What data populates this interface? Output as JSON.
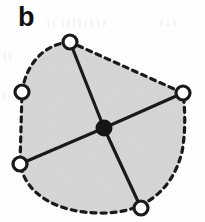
{
  "figure": {
    "panel_label": "b",
    "caption_text": "",
    "type": "node-link-diagram"
  },
  "style": {
    "background_color": "#fefefe",
    "region_fill_color": "#d6d6d6",
    "region_stroke_color": "#1a1a1a",
    "region_stroke_width": 3.2,
    "region_dash_pattern": "5 5",
    "spoke_color": "#1a1a1a",
    "spoke_width": 3.2,
    "node_fill_color": "#ffffff",
    "node_stroke_color": "#1a1a1a",
    "node_stroke_width": 3.2,
    "node_radius": 7,
    "hub_fill_color": "#151515",
    "hub_radius": 8.5,
    "label_color": "#111111"
  },
  "graph": {
    "hub": {
      "id": "hub",
      "name": "central-hub",
      "x": 104,
      "y": 128,
      "filled": true
    },
    "nodes": [
      {
        "id": "n1",
        "name": "node-top",
        "x": 70,
        "y": 42,
        "filled": false
      },
      {
        "id": "n2",
        "name": "node-upper-left",
        "x": 22,
        "y": 92,
        "filled": false
      },
      {
        "id": "n3",
        "name": "node-right",
        "x": 183,
        "y": 93,
        "filled": false
      },
      {
        "id": "n4",
        "name": "node-lower-left",
        "x": 20,
        "y": 164,
        "filled": false
      },
      {
        "id": "n5",
        "name": "node-bottom",
        "x": 141,
        "y": 208,
        "filled": false
      }
    ],
    "edges": [
      {
        "id": "e1",
        "name": "spoke-hub-to-top",
        "from": "hub",
        "to": "n1"
      },
      {
        "id": "e2",
        "name": "spoke-hub-to-right",
        "from": "hub",
        "to": "n3"
      },
      {
        "id": "e3",
        "name": "spoke-hub-to-lower-left",
        "from": "hub",
        "to": "n4"
      },
      {
        "id": "e4",
        "name": "spoke-hub-to-bottom",
        "from": "hub",
        "to": "n5"
      }
    ],
    "boundary": {
      "name": "dashed-region-outline",
      "path": "M 70 42 C 44 44 26 64 22 92 L 20 164 C 26 196 60 213 100 213 C 142 214 172 192 182 152 C 186 130 185 108 183 93 L 70 42 Z",
      "closed": true,
      "dashed": true
    }
  }
}
